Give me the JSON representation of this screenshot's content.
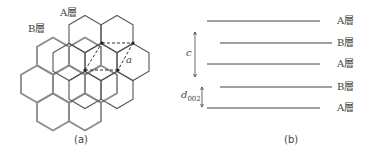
{
  "panel_a": {
    "caption": "(a)",
    "label_a_layer": "A層",
    "label_b_layer": "B層",
    "lattice_constant_label": "a",
    "colors": {
      "a_layer": "#555555",
      "b_layer": "#8a8a8a",
      "dashed": "#333333"
    },
    "a_layer_hex_centers": [
      [
        85,
        34
      ],
      [
        117,
        34
      ],
      [
        69,
        62
      ],
      [
        101,
        62
      ],
      [
        133,
        62
      ],
      [
        85,
        90
      ],
      [
        117,
        90
      ]
    ],
    "b_layer_hex_centers": [
      [
        53,
        56
      ],
      [
        85,
        56
      ],
      [
        37,
        84
      ],
      [
        69,
        84
      ],
      [
        101,
        84
      ],
      [
        53,
        112
      ],
      [
        85,
        112
      ]
    ],
    "unit_cell_vertices": [
      [
        102,
        43
      ],
      [
        133,
        43
      ],
      [
        118,
        70
      ],
      [
        85,
        70
      ]
    ]
  },
  "panel_b": {
    "caption": "(b)",
    "layers": [
      {
        "label": "A層",
        "y": 21,
        "x1": 207,
        "x2": 320
      },
      {
        "label": "B層",
        "y": 43,
        "x1": 220,
        "x2": 332
      },
      {
        "label": "A層",
        "y": 64,
        "x1": 207,
        "x2": 320
      },
      {
        "label": "B層",
        "y": 87,
        "x1": 220,
        "x2": 332
      },
      {
        "label": "A層",
        "y": 108,
        "x1": 207,
        "x2": 320
      }
    ],
    "c_label": "c",
    "d_label": "d",
    "d_subscript": "002"
  }
}
